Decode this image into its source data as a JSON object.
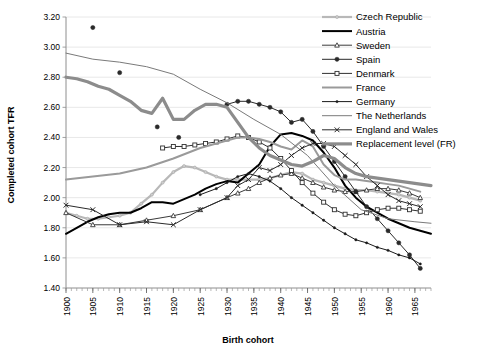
{
  "chart_data": {
    "type": "line",
    "title": "",
    "xlabel": "Birth cohort",
    "ylabel": "Completed cohort TFR",
    "xlim": [
      1900,
      1968
    ],
    "ylim": [
      1.4,
      3.2
    ],
    "ytick_step": 0.2,
    "xtick_step": 5,
    "grid": "horizontal",
    "legend_position": "top-right",
    "yticks": [
      "1.40",
      "1.60",
      "1.80",
      "2.00",
      "2.20",
      "2.40",
      "2.60",
      "2.80",
      "3.00",
      "3.20"
    ],
    "xticks": [
      "1900",
      "1905",
      "1910",
      "1915",
      "1920",
      "1925",
      "1930",
      "1935",
      "1940",
      "1945",
      "1950",
      "1955",
      "1960",
      "1965"
    ],
    "series": [
      {
        "name": "Czech Republic",
        "color": "#b8b8b8",
        "marker": "dot-small",
        "width": 2.2,
        "x": [
          1900,
          1902,
          1904,
          1906,
          1908,
          1910,
          1912,
          1914,
          1916,
          1918,
          1920,
          1922,
          1924,
          1926,
          1928,
          1930,
          1932,
          1934,
          1936,
          1938,
          1940,
          1942,
          1944,
          1946,
          1948,
          1950,
          1952,
          1954,
          1956,
          1958,
          1960,
          1962,
          1964,
          1966
        ],
        "values": [
          1.9,
          1.88,
          1.86,
          1.86,
          1.87,
          1.88,
          1.9,
          1.96,
          2.02,
          2.1,
          2.17,
          2.21,
          2.2,
          2.17,
          2.14,
          2.12,
          2.12,
          2.12,
          2.12,
          2.13,
          2.15,
          2.17,
          2.16,
          2.12,
          2.1,
          2.08,
          2.06,
          2.05,
          2.05,
          2.04,
          2.03,
          2.02,
          2.0,
          1.98
        ]
      },
      {
        "name": "Austria",
        "color": "#000000",
        "marker": "none",
        "width": 2.0,
        "x": [
          1900,
          1902,
          1904,
          1906,
          1908,
          1910,
          1912,
          1914,
          1916,
          1918,
          1920,
          1922,
          1924,
          1926,
          1928,
          1930,
          1932,
          1934,
          1936,
          1938,
          1940,
          1942,
          1944,
          1946,
          1948,
          1950,
          1952,
          1954,
          1956,
          1958,
          1960,
          1962,
          1964,
          1966,
          1968
        ],
        "values": [
          1.76,
          1.8,
          1.84,
          1.87,
          1.89,
          1.9,
          1.9,
          1.93,
          1.97,
          1.97,
          1.96,
          1.99,
          2.02,
          2.06,
          2.09,
          2.11,
          2.1,
          2.16,
          2.22,
          2.34,
          2.42,
          2.43,
          2.41,
          2.38,
          2.3,
          2.2,
          2.08,
          2.0,
          1.94,
          1.9,
          1.86,
          1.83,
          1.8,
          1.78,
          1.76
        ]
      },
      {
        "name": "Sweden",
        "color": "#3a3a3a",
        "marker": "triangle-open",
        "width": 1.0,
        "x": [
          1900,
          1905,
          1910,
          1915,
          1920,
          1925,
          1930,
          1932,
          1934,
          1936,
          1938,
          1940,
          1942,
          1944,
          1946,
          1948,
          1950,
          1952,
          1954,
          1956,
          1958,
          1960,
          1962,
          1964,
          1966
        ],
        "values": [
          1.9,
          1.82,
          1.82,
          1.85,
          1.88,
          1.92,
          2.0,
          2.03,
          2.06,
          2.1,
          2.13,
          2.15,
          2.16,
          2.13,
          2.1,
          2.07,
          2.05,
          2.04,
          2.04,
          2.05,
          2.06,
          2.06,
          2.05,
          2.03,
          2.0
        ]
      },
      {
        "name": "Spain",
        "color": "#2a2a2a",
        "marker": "dot-filled",
        "width": 1.0,
        "x": [
          1905,
          1910,
          1917,
          1921,
          1930,
          1932,
          1934,
          1936,
          1938,
          1940,
          1942,
          1944,
          1946,
          1948,
          1950,
          1952,
          1954,
          1956,
          1958,
          1960,
          1962,
          1964,
          1966
        ],
        "values": [
          3.13,
          2.83,
          2.47,
          2.4,
          2.62,
          2.64,
          2.64,
          2.62,
          2.6,
          2.57,
          2.5,
          2.52,
          2.44,
          2.34,
          2.24,
          2.14,
          2.04,
          1.94,
          1.86,
          1.78,
          1.7,
          1.62,
          1.53
        ]
      },
      {
        "name": "Denmark",
        "color": "#303030",
        "marker": "square-open",
        "width": 1.0,
        "x": [
          1918,
          1920,
          1922,
          1924,
          1926,
          1928,
          1930,
          1932,
          1934,
          1936,
          1938,
          1940,
          1942,
          1944,
          1946,
          1948,
          1950,
          1952,
          1954,
          1956,
          1958,
          1960,
          1962,
          1964,
          1966
        ],
        "values": [
          2.33,
          2.34,
          2.34,
          2.35,
          2.36,
          2.37,
          2.39,
          2.41,
          2.4,
          2.37,
          2.33,
          2.26,
          2.18,
          2.1,
          2.03,
          1.97,
          1.92,
          1.89,
          1.88,
          1.9,
          1.92,
          1.93,
          1.93,
          1.92,
          1.91
        ]
      },
      {
        "name": "France",
        "color": "#9a9a9a",
        "marker": "none",
        "width": 2.0,
        "x": [
          1900,
          1905,
          1910,
          1915,
          1920,
          1925,
          1930,
          1932,
          1934,
          1936,
          1938,
          1940,
          1942,
          1944,
          1946,
          1948,
          1950,
          1952,
          1954,
          1956,
          1958,
          1960,
          1962,
          1964,
          1966
        ],
        "values": [
          2.12,
          2.14,
          2.16,
          2.2,
          2.26,
          2.33,
          2.38,
          2.4,
          2.4,
          2.39,
          2.37,
          2.34,
          2.32,
          2.38,
          2.34,
          2.22,
          2.15,
          2.12,
          2.12,
          2.11,
          2.1,
          2.09,
          2.08,
          2.06,
          2.04
        ]
      },
      {
        "name": "Germany",
        "color": "#1a1a1a",
        "marker": "dot-tiny",
        "width": 1.0,
        "x": [
          1925,
          1928,
          1930,
          1932,
          1934,
          1936,
          1938,
          1940,
          1942,
          1944,
          1946,
          1948,
          1950,
          1952,
          1954,
          1956,
          1958,
          1960,
          1962,
          1964,
          1966
        ],
        "values": [
          2.02,
          2.06,
          2.1,
          2.14,
          2.16,
          2.14,
          2.11,
          2.06,
          2.0,
          1.95,
          1.9,
          1.85,
          1.8,
          1.76,
          1.72,
          1.7,
          1.67,
          1.65,
          1.62,
          1.6,
          1.56
        ]
      },
      {
        "name": "The Netherlands",
        "color": "#7a7a7a",
        "marker": "none",
        "width": 1.0,
        "x": [
          1900,
          1905,
          1910,
          1915,
          1920,
          1925,
          1930,
          1935,
          1940,
          1945,
          1950,
          1955,
          1960,
          1965,
          1968
        ],
        "values": [
          2.96,
          2.92,
          2.9,
          2.87,
          2.82,
          2.72,
          2.63,
          2.52,
          2.42,
          2.28,
          2.08,
          1.92,
          1.86,
          1.84,
          1.83
        ]
      },
      {
        "name": "England and Wales",
        "color": "#2a2a2a",
        "marker": "x-mark",
        "width": 1.0,
        "x": [
          1900,
          1905,
          1910,
          1915,
          1920,
          1925,
          1930,
          1932,
          1934,
          1936,
          1938,
          1940,
          1942,
          1944,
          1946,
          1948,
          1950,
          1952,
          1954,
          1956,
          1958,
          1960,
          1962,
          1964,
          1966
        ],
        "values": [
          1.95,
          1.92,
          1.82,
          1.84,
          1.82,
          1.92,
          2.0,
          2.08,
          2.12,
          2.2,
          2.18,
          2.22,
          2.28,
          2.33,
          2.36,
          2.36,
          2.34,
          2.28,
          2.22,
          2.14,
          2.08,
          2.02,
          1.98,
          1.96,
          1.94
        ]
      },
      {
        "name": "Replacement level (FR)",
        "color": "#8c8c8c",
        "marker": "none",
        "width": 3.2,
        "x": [
          1900,
          1902,
          1904,
          1906,
          1908,
          1910,
          1912,
          1914,
          1916,
          1918,
          1920,
          1922,
          1924,
          1926,
          1928,
          1930,
          1932,
          1934,
          1936,
          1938,
          1940,
          1942,
          1944,
          1946,
          1948,
          1950,
          1952,
          1954,
          1956,
          1958,
          1960,
          1962,
          1964,
          1966,
          1968
        ],
        "values": [
          2.8,
          2.79,
          2.77,
          2.74,
          2.72,
          2.68,
          2.64,
          2.58,
          2.56,
          2.66,
          2.52,
          2.52,
          2.58,
          2.62,
          2.62,
          2.6,
          2.5,
          2.4,
          2.33,
          2.28,
          2.25,
          2.22,
          2.21,
          2.24,
          2.28,
          2.26,
          2.2,
          2.16,
          2.14,
          2.13,
          2.12,
          2.11,
          2.1,
          2.09,
          2.08
        ]
      }
    ]
  },
  "legend": {
    "items": [
      {
        "label": "Czech Republic"
      },
      {
        "label": "Austria"
      },
      {
        "label": "Sweden"
      },
      {
        "label": "Spain"
      },
      {
        "label": "Denmark"
      },
      {
        "label": "France"
      },
      {
        "label": "Germany"
      },
      {
        "label": "The Netherlands"
      },
      {
        "label": "England and Wales"
      },
      {
        "label": "Replacement level (FR)"
      }
    ]
  }
}
